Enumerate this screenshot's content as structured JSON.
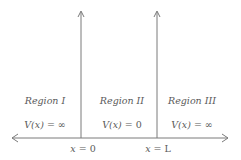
{
  "diagram": {
    "colors": {
      "line": "#7a7a7a",
      "text": "#5a5a5a",
      "background": "#ffffff"
    },
    "regions": [
      {
        "name": "Region I",
        "potential_var": "V(x)",
        "potential_eq": "= ∞"
      },
      {
        "name": "Region II",
        "potential_var": "V(x)",
        "potential_eq": "= 0"
      },
      {
        "name": "Region III",
        "potential_var": "V(x)",
        "potential_eq": "= ∞"
      }
    ],
    "boundaries": [
      {
        "var": "x",
        "eq": "= 0"
      },
      {
        "var": "x",
        "eq": "= L"
      }
    ],
    "axis": {
      "direction": "bidirectional",
      "orientation": "horizontal"
    }
  }
}
